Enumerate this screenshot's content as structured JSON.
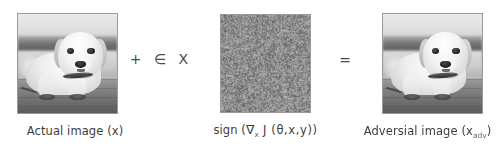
{
  "figure": {
    "background_color": "#ffffff",
    "text_color": "#3d3d3d"
  },
  "panels": [
    {
      "id": "actual",
      "caption": "Actual image (x)",
      "image_kind": "photo",
      "image_subject": "grayscale photo of a yellow labrador puppy lying on a wooden deck",
      "border_color": "#9a9a9a"
    },
    {
      "id": "noise",
      "caption_prefix": "sign (",
      "caption_nabla": "∇",
      "caption_nabla_sub": "x",
      "caption_mid": " J (θ,x,y))",
      "caption_plain": "sign (∇x J (θ,x,y))",
      "image_kind": "noise",
      "image_subject": "uniform gray sign-of-gradient noise pattern",
      "border_color": "#9a9a9a"
    },
    {
      "id": "adversarial",
      "caption_prefix": "Adversial image (x",
      "caption_sub": "adv",
      "caption_suffix": ")",
      "caption_plain": "Adversial image (x_adv)",
      "image_kind": "photo",
      "image_subject": "grayscale photo of a yellow labrador puppy lying on a wooden deck",
      "border_color": "#9a9a9a"
    }
  ],
  "operators": {
    "plus_epsilon": "+  ∈  X",
    "plus": "+",
    "epsilon": "∈",
    "multiplier": "X",
    "equals": "="
  }
}
